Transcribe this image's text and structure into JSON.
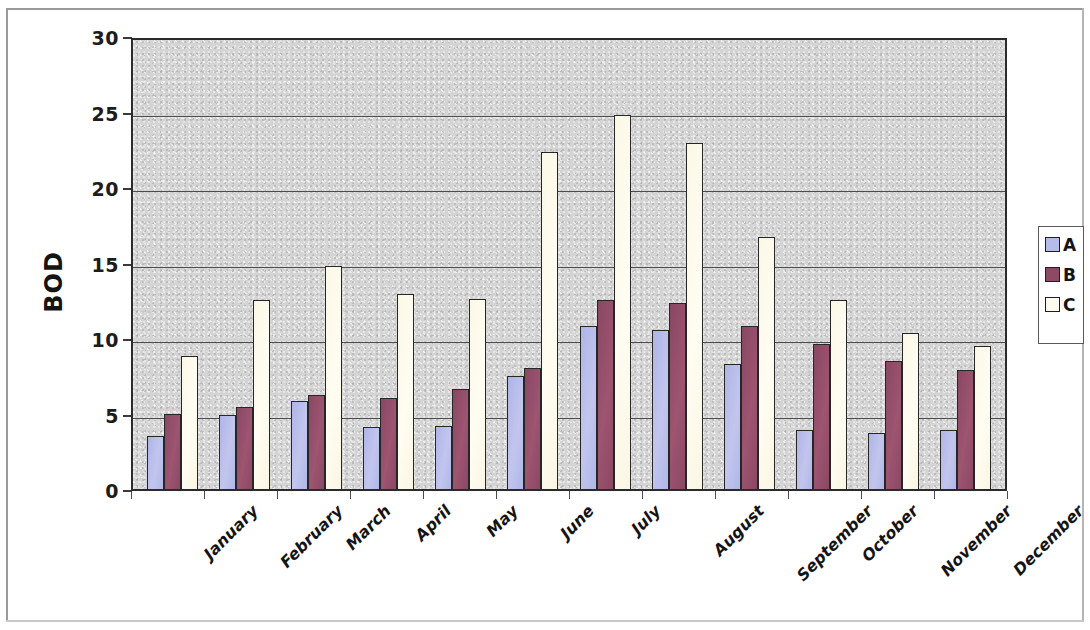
{
  "chart_data": {
    "type": "bar",
    "title": "",
    "xlabel": "",
    "ylabel": "BOD",
    "ylim": [
      0,
      30
    ],
    "yticks": [
      0,
      5,
      10,
      15,
      20,
      25,
      30
    ],
    "grid": true,
    "legend_position": "right",
    "categories": [
      "January",
      "February",
      "March",
      "April",
      "May",
      "June",
      "July",
      "August",
      "September",
      "October",
      "November",
      "December"
    ],
    "series": [
      {
        "name": "A",
        "color": "#b6bce9",
        "values": [
          3.5,
          4.9,
          5.8,
          4.1,
          4.2,
          7.5,
          10.8,
          10.5,
          8.3,
          3.9,
          3.7,
          3.9
        ]
      },
      {
        "name": "B",
        "color": "#8c4a65",
        "values": [
          5.0,
          5.4,
          6.2,
          6.0,
          6.6,
          8.0,
          12.5,
          12.3,
          10.8,
          9.6,
          8.5,
          7.9
        ]
      },
      {
        "name": "C",
        "color": "#fdfbef",
        "values": [
          8.8,
          12.5,
          14.8,
          12.9,
          12.6,
          22.3,
          24.8,
          22.9,
          16.7,
          12.5,
          10.3,
          9.5
        ]
      }
    ]
  },
  "axis": {
    "y_title": "BOD",
    "y_tick_labels": [
      "30",
      "25",
      "20",
      "15",
      "10",
      "5",
      "0"
    ]
  },
  "legend": {
    "items": [
      {
        "label": "A"
      },
      {
        "label": "B"
      },
      {
        "label": "C"
      }
    ]
  },
  "colors": {
    "series_a": "#b6bce9",
    "series_b": "#8c4a65",
    "series_c": "#fdfbef",
    "plot_background": "#d4d4d4",
    "axis_line": "#2b2b2b",
    "gridline": "#4c4c4c"
  }
}
